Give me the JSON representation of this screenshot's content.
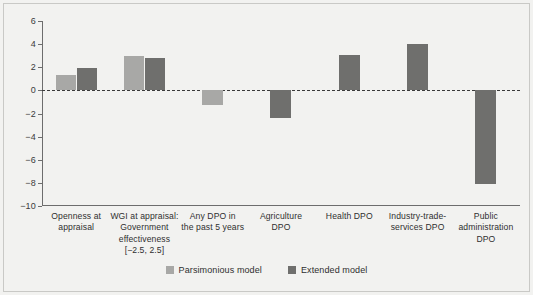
{
  "chart_data": {
    "type": "bar",
    "title": "",
    "subtitle": "",
    "xlabel": "",
    "ylabel": "",
    "ylim": [
      -10,
      6
    ],
    "yticks": [
      6,
      4,
      2,
      0,
      -2,
      -4,
      -6,
      -8,
      -10
    ],
    "ytick_labels": [
      "6",
      "4",
      "2",
      "0",
      "−2",
      "−4",
      "−6",
      "−8",
      "−10"
    ],
    "grid": false,
    "zero_reference_line": true,
    "legend_position": "bottom-center",
    "categories": [
      "Openness at appraisal",
      "WGI at appraisal: Government effectiveness [−2.5, 2.5]",
      "Any DPO in the past 5 years",
      "Agriculture DPO",
      "Health DPO",
      "Industry-trade-services DPO",
      "Public administration DPO"
    ],
    "category_label_lines": [
      [
        "Openness at",
        "appraisal"
      ],
      [
        "WGI at appraisal:",
        "Government",
        "effectiveness",
        "[−2.5, 2.5]"
      ],
      [
        "Any DPO in",
        "the past 5 years"
      ],
      [
        "Agriculture",
        "DPO"
      ],
      [
        "Health DPO"
      ],
      [
        "Industry-trade-",
        "services DPO"
      ],
      [
        "Public",
        "administration",
        "DPO"
      ]
    ],
    "series": [
      {
        "name": "Parsimonious model",
        "color": "#a8a8a6",
        "values": [
          1.3,
          3.0,
          -1.3,
          null,
          null,
          null,
          null
        ]
      },
      {
        "name": "Extended model",
        "color": "#6f6f6d",
        "values": [
          1.9,
          2.8,
          null,
          -2.4,
          3.1,
          4.0,
          -8.1
        ]
      }
    ],
    "legend": [
      "Parsimonious model",
      "Extended model"
    ]
  },
  "colors": {
    "background": "#f2f2f0",
    "axis": "#6d6d6d",
    "text": "#2f2f2f",
    "light_series": "#a8a8a6",
    "dark_series": "#6f6f6d",
    "zero_line": "#3a3a3a"
  }
}
